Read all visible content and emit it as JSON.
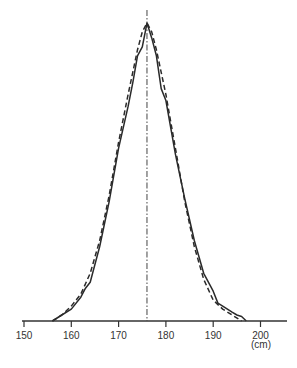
{
  "chart_data": {
    "type": "line",
    "title": "",
    "xlabel": "(cm)",
    "ylabel": "",
    "xlim": [
      150,
      205
    ],
    "ylim": [
      0,
      1.02
    ],
    "grid": false,
    "legend": null,
    "x_ticks": [
      150,
      160,
      170,
      180,
      190,
      200
    ],
    "x_tick_labels": [
      "150",
      "160",
      "170",
      "180",
      "190",
      "200"
    ],
    "mean_line": {
      "x": 176,
      "style": "dash-dot"
    },
    "series": [
      {
        "name": "observed",
        "style": "solid",
        "x": [
          156,
          158,
          160,
          162,
          163,
          164,
          166,
          168,
          170,
          172,
          173,
          174,
          175,
          176,
          177,
          178,
          179,
          180,
          182,
          184,
          186,
          188,
          190,
          191,
          192,
          193,
          194,
          195,
          196,
          197
        ],
        "values": [
          0.0,
          0.02,
          0.04,
          0.08,
          0.11,
          0.13,
          0.25,
          0.4,
          0.58,
          0.72,
          0.8,
          0.89,
          0.92,
          1.0,
          0.95,
          0.89,
          0.78,
          0.74,
          0.56,
          0.41,
          0.27,
          0.16,
          0.1,
          0.06,
          0.05,
          0.04,
          0.03,
          0.02,
          0.015,
          0.0
        ]
      },
      {
        "name": "normal fit",
        "style": "dashed",
        "x": [
          156,
          158,
          160,
          162,
          164,
          166,
          168,
          170,
          172,
          174,
          175,
          176,
          177,
          178,
          180,
          182,
          184,
          186,
          188,
          190,
          192,
          194,
          196
        ],
        "values": [
          0.0,
          0.02,
          0.05,
          0.09,
          0.16,
          0.27,
          0.42,
          0.6,
          0.76,
          0.91,
          0.97,
          1.0,
          0.97,
          0.91,
          0.76,
          0.58,
          0.4,
          0.25,
          0.14,
          0.07,
          0.04,
          0.02,
          0.0
        ]
      }
    ]
  },
  "axis": {
    "unit_label": "(cm)"
  }
}
